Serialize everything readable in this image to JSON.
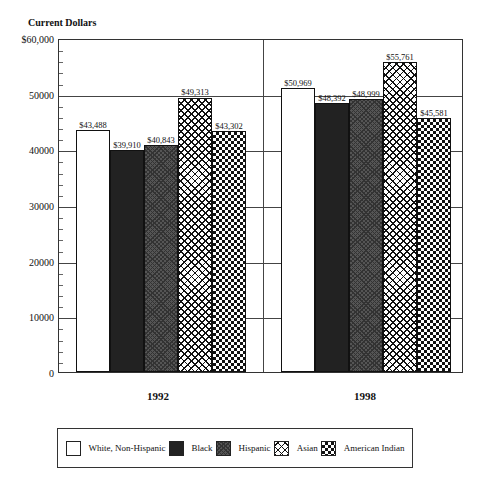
{
  "chart_data": {
    "type": "bar",
    "title": "",
    "ylabel": "Current Dollars",
    "xlabel": "",
    "categories": [
      "1992",
      "1998"
    ],
    "series": [
      {
        "name": "White, Non-Hispanic",
        "values": [
          43488,
          50969
        ],
        "labels": [
          "$43,488",
          "$50,969"
        ],
        "pattern": "white"
      },
      {
        "name": "Black",
        "values": [
          39910,
          48392
        ],
        "labels": [
          "$39,910",
          "$48,392"
        ],
        "pattern": "black"
      },
      {
        "name": "Hispanic",
        "values": [
          40843,
          48999
        ],
        "labels": [
          "$40,843",
          "$48,999"
        ],
        "pattern": "hisp"
      },
      {
        "name": "Asian",
        "values": [
          49313,
          55761
        ],
        "labels": [
          "$49,313",
          "$55,761"
        ],
        "pattern": "asian"
      },
      {
        "name": "American Indian",
        "values": [
          43302,
          45581
        ],
        "labels": [
          "$43,302",
          "$45,581"
        ],
        "pattern": "amind"
      }
    ],
    "ylim": [
      0,
      60000
    ],
    "yticks": [
      {
        "value": 0,
        "label": "0"
      },
      {
        "value": 10000,
        "label": "10000"
      },
      {
        "value": 20000,
        "label": "20000"
      },
      {
        "value": 30000,
        "label": "30000"
      },
      {
        "value": 40000,
        "label": "40000"
      },
      {
        "value": 50000,
        "label": "50000"
      },
      {
        "value": 60000,
        "label": "$60,000"
      }
    ],
    "grid": true,
    "legend_position": "bottom"
  },
  "axis": {
    "title": "Current Dollars"
  },
  "legend": {
    "items": [
      {
        "label": "White, Non-Hispanic",
        "pattern": "white"
      },
      {
        "label": "Black",
        "pattern": "black"
      },
      {
        "label": "Hispanic",
        "pattern": "hisp"
      },
      {
        "label": "Asian",
        "pattern": "asian"
      },
      {
        "label": "American Indian",
        "pattern": "amind"
      }
    ]
  }
}
